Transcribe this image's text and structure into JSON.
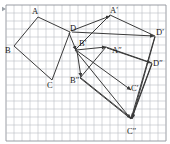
{
  "figure": {
    "kind": "geometry-diagram",
    "grid": {
      "visible": true,
      "cell_px": 8,
      "left": 6,
      "top": 5,
      "cols": 20,
      "rows": 17,
      "line_color": "#b9bcc4",
      "border_color": "#8e929a"
    },
    "style": {
      "shape_stroke": "#3a3a3a",
      "arrow_stroke": "#3a3a3a",
      "stroke_width": 1,
      "label_color": "#1a1a1a",
      "background": "#ffffff"
    },
    "edge_marker": {
      "name": "left-edge-arrow",
      "x": 2,
      "y": 9
    },
    "polygons": [
      {
        "name": "quadrilateral-abcd",
        "id": "ABCD",
        "closed": true,
        "points": [
          [
            38,
            17
          ],
          [
            14,
            46
          ],
          [
            52,
            80
          ],
          [
            70,
            32
          ]
        ]
      },
      {
        "name": "quadrilateral-a-prime",
        "id": "A'B'C'D'",
        "closed": true,
        "points": [
          [
            110,
            15
          ],
          [
            75,
            50
          ],
          [
            131,
            119
          ],
          [
            155,
            36
          ]
        ]
      },
      {
        "name": "quadrilateral-a-double-prime",
        "id": "A''B''C''D''",
        "closed": true,
        "points": [
          [
            106,
            47
          ],
          [
            80,
            78
          ],
          [
            131,
            119
          ],
          [
            152,
            63
          ]
        ]
      }
    ],
    "arrows": [
      {
        "name": "vector-a-to-a-prime",
        "from": [
          71,
          31
        ],
        "to": [
          110,
          16
        ]
      },
      {
        "name": "vector-d-to-d-prime",
        "from": [
          72,
          32
        ],
        "to": [
          154,
          36
        ]
      },
      {
        "name": "vector-d-to-b-prime",
        "from": [
          69,
          33
        ],
        "to": [
          76,
          50
        ]
      },
      {
        "name": "vector-b-prime-to-a-double-prime",
        "from": [
          76,
          50
        ],
        "to": [
          106,
          47
        ]
      },
      {
        "name": "vector-b-prime-to-c-prime",
        "from": [
          76,
          50
        ],
        "to": [
          131,
          90
        ]
      },
      {
        "name": "vector-b-prime-to-b-double-prime",
        "from": [
          77,
          51
        ],
        "to": [
          81,
          77
        ]
      },
      {
        "name": "vector-a-double-prime-to-d-double-prime",
        "from": [
          107,
          48
        ],
        "to": [
          151,
          63
        ]
      },
      {
        "name": "vector-b-double-prime-to-c-double-prime",
        "from": [
          81,
          78
        ],
        "to": [
          131,
          118
        ]
      },
      {
        "name": "vector-d-prime-to-c-double-prime",
        "from": [
          155,
          37
        ],
        "to": [
          132,
          119
        ]
      },
      {
        "name": "vector-d-double-prime-to-c-double-prime",
        "from": [
          152,
          64
        ],
        "to": [
          132,
          118
        ]
      }
    ],
    "labels": [
      {
        "name": "vertex-label-a",
        "text": "A",
        "x": 32,
        "y": 7
      },
      {
        "name": "vertex-label-b",
        "text": "B",
        "x": 5,
        "y": 46
      },
      {
        "name": "vertex-label-c",
        "text": "C",
        "x": 47,
        "y": 81
      },
      {
        "name": "vertex-label-d",
        "text": "D",
        "x": 70,
        "y": 24
      },
      {
        "name": "vertex-label-a-prime",
        "text": "A′",
        "x": 110,
        "y": 6
      },
      {
        "name": "vertex-label-b-prime",
        "text": "B′",
        "x": 79,
        "y": 39
      },
      {
        "name": "vertex-label-c-prime",
        "text": "C′",
        "x": 131,
        "y": 84
      },
      {
        "name": "vertex-label-d-prime",
        "text": "D′",
        "x": 156,
        "y": 28
      },
      {
        "name": "vertex-label-a-double-prime",
        "text": "A″",
        "x": 112,
        "y": 46
      },
      {
        "name": "vertex-label-b-double-prime",
        "text": "B″",
        "x": 70,
        "y": 76
      },
      {
        "name": "vertex-label-c-double-prime",
        "text": "C″",
        "x": 127,
        "y": 127
      },
      {
        "name": "vertex-label-d-double-prime",
        "text": "D″",
        "x": 153,
        "y": 59
      }
    ]
  }
}
